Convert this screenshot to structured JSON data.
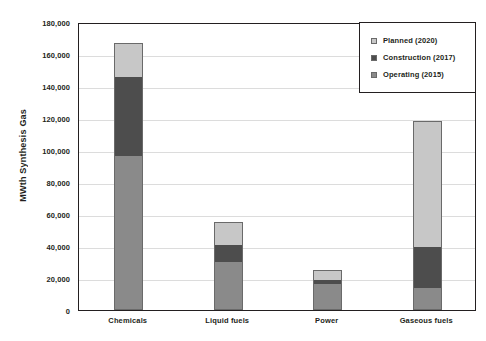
{
  "chart_data": {
    "type": "bar",
    "stacked": true,
    "title": "",
    "xlabel": "",
    "ylabel": "MWth Synthesis Gas",
    "ylim": [
      0,
      180000
    ],
    "ytick_step": 20000,
    "ytick_labels": [
      "180,000",
      "160,000",
      "140,000",
      "120,000",
      "100,000",
      "80,000",
      "60,000",
      "40,000",
      "20,000",
      "0"
    ],
    "ytick_values": [
      180000,
      160000,
      140000,
      120000,
      100000,
      80000,
      60000,
      40000,
      20000,
      0
    ],
    "grid": true,
    "legend_position": "top-right",
    "categories": [
      "Chemicals",
      "Liquid fuels",
      "Power",
      "Gaseous fuels"
    ],
    "series": [
      {
        "name": "Operating (2015)",
        "color": "#8a8a8a",
        "values": [
          96500,
          30000,
          16500,
          13500
        ]
      },
      {
        "name": "Construction (2017)",
        "color": "#4d4d4d",
        "values": [
          49000,
          10500,
          2500,
          26000
        ]
      },
      {
        "name": "Planned (2020)",
        "color": "#c7c7c7",
        "values": [
          21500,
          14500,
          6000,
          78500
        ]
      }
    ],
    "totals": [
      167000,
      55000,
      25000,
      118000
    ]
  },
  "legend": {
    "items": [
      {
        "label": "Planned (2020)",
        "color": "#c7c7c7"
      },
      {
        "label": "Construction (2017)",
        "color": "#4d4d4d"
      },
      {
        "label": "Operating (2015)",
        "color": "#8a8a8a"
      }
    ]
  }
}
